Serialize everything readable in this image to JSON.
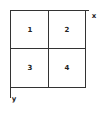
{
  "diagram": {
    "type": "quadrant-grid",
    "quadrants": [
      {
        "id": 1,
        "label": "1",
        "position": "top-left"
      },
      {
        "id": 2,
        "label": "2",
        "position": "top-right"
      },
      {
        "id": 3,
        "label": "3",
        "position": "bottom-left"
      },
      {
        "id": 4,
        "label": "4",
        "position": "bottom-right"
      }
    ],
    "axes": {
      "x_label": "x",
      "y_label": "y"
    },
    "colors": {
      "line": "#333333",
      "text": "#222222",
      "background": "#ffffff"
    }
  }
}
